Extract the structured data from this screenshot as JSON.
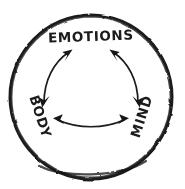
{
  "diagram": {
    "style": "hand-drawn sketch",
    "background_color": "#ffffff",
    "ink_color": "#1a1a1a",
    "border": {
      "shape": "circle",
      "name": "hand-drawn circle outline",
      "center_x": 91,
      "center_y": 97,
      "radius_x": 81,
      "radius_y": 82,
      "stroke_width": 3.2
    },
    "nodes": [
      {
        "id": "emotions",
        "label": "EMOTIONS",
        "position": "top",
        "x": 91,
        "y": 41,
        "rotation": 0,
        "font_size": 13.5
      },
      {
        "id": "body",
        "label": "BODY",
        "position": "bottom-left",
        "x": 36,
        "y": 118,
        "rotation": 72,
        "font_size": 13.5
      },
      {
        "id": "mind",
        "label": "MIND",
        "position": "bottom-right",
        "x": 146,
        "y": 118,
        "rotation": -72,
        "font_size": 13.5
      }
    ],
    "connections": [
      {
        "id": "body-emotions",
        "from": "body",
        "to": "emotions",
        "arrow": "double",
        "curve": "arc"
      },
      {
        "id": "emotions-mind",
        "from": "emotions",
        "to": "mind",
        "arrow": "double",
        "curve": "arc"
      },
      {
        "id": "body-mind",
        "from": "body",
        "to": "mind",
        "arrow": "double",
        "curve": "arc"
      }
    ]
  }
}
